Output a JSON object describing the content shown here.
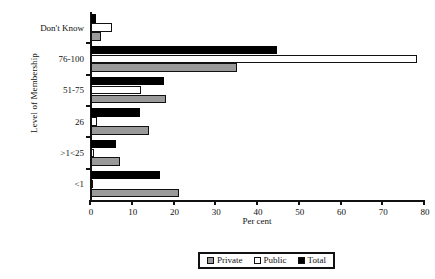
{
  "chart_data": {
    "type": "bar",
    "orientation": "horizontal",
    "title": "",
    "xlabel": "Per cent",
    "ylabel": "Level of Membership",
    "categories": [
      "<1",
      ">1<25",
      "26",
      "51-75",
      "76-100",
      "Don't Know"
    ],
    "series": [
      {
        "name": "Private",
        "color": "#9a9a9a",
        "values": [
          21,
          7,
          14,
          18,
          35,
          2.5
        ]
      },
      {
        "name": "Public",
        "color": "#ffffff",
        "values": [
          0.3,
          0.7,
          1.5,
          12,
          78,
          5
        ]
      },
      {
        "name": "Total",
        "color": "#000000",
        "values": [
          16.5,
          6,
          11.7,
          17.5,
          44.5,
          1.2
        ]
      }
    ],
    "xlim": [
      0,
      80
    ],
    "xticks": [
      0,
      10,
      20,
      30,
      40,
      50,
      60,
      70,
      80
    ],
    "xtick_labels": [
      "0",
      "10",
      "20",
      "30",
      "40",
      "50",
      "60",
      "70",
      "80"
    ],
    "grid": false,
    "legend_position": "bottom-center",
    "legend_entries": [
      "Private",
      "Public",
      "Total"
    ]
  }
}
